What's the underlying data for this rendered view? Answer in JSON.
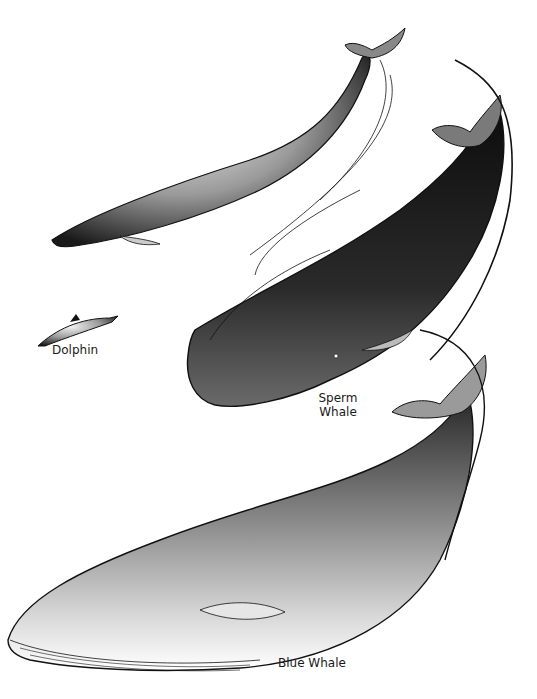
{
  "illustration": {
    "subject": "whale size comparison illustration",
    "colors": {
      "ink": "#111111",
      "background": "#ffffff"
    },
    "labels": {
      "dolphin": "Dolphin",
      "sperm_whale_line1": "Sperm",
      "sperm_whale_line2": "Whale",
      "blue_whale": "Blue Whale"
    }
  }
}
